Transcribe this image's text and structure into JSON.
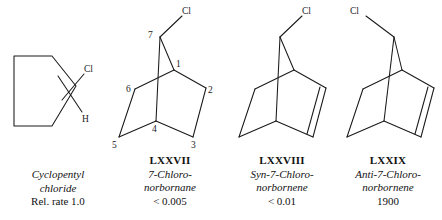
{
  "figure": {
    "kind": "chemical-structure-comparison"
  },
  "structures": [
    {
      "id": "cyclopentyl-chloride",
      "roman": "",
      "name_line1": "Cyclopentyl",
      "name_line2": "chloride",
      "rate": "Rel. rate 1.0",
      "atom_labels": [
        "Cl",
        "H"
      ],
      "ring": "cyclopentane",
      "has_double_bond": false
    },
    {
      "id": "7-chloronorbornane",
      "roman": "LXXVII",
      "name_line1": "7-Chloro-",
      "name_line2": "norbornane",
      "rate": "< 0.005",
      "atom_labels": [
        "Cl"
      ],
      "position_numbers": [
        "1",
        "2",
        "3",
        "4",
        "5",
        "6",
        "7"
      ],
      "ring": "norbornane",
      "has_double_bond": false
    },
    {
      "id": "syn-7-chloronorbornene",
      "roman": "LXXVIII",
      "name_line1": "Syn-7-Chloro-",
      "name_line2": "norbornene",
      "rate": "< 0.01",
      "atom_labels": [
        "Cl"
      ],
      "ring": "norbornene",
      "has_double_bond": true,
      "cl_orientation": "syn"
    },
    {
      "id": "anti-7-chloronorbornene",
      "roman": "LXXIX",
      "name_line1": "Anti-7-Chloro-",
      "name_line2": "norbornene",
      "rate": "1900",
      "atom_labels": [
        "Cl"
      ],
      "ring": "norbornene",
      "has_double_bond": true,
      "cl_orientation": "anti"
    }
  ],
  "colors": {
    "ink": "#1a1a1a",
    "background": "#ffffff"
  }
}
